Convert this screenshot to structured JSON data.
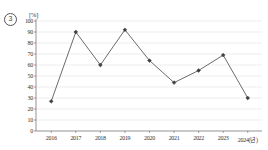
{
  "question_number": "3",
  "chart_data": {
    "type": "line",
    "title": "",
    "xlabel": "",
    "ylabel": "",
    "unit_label": "[%]",
    "x_axis_suffix": "(년)",
    "categories": [
      "2016",
      "2017",
      "2018",
      "2019",
      "2020",
      "2021",
      "2022",
      "2023",
      "2024"
    ],
    "x_tick_labels": [
      "2016",
      "2017",
      "2018",
      "2019",
      "2020",
      "2021",
      "2022",
      "2023",
      "2024(년)"
    ],
    "values": [
      27,
      90,
      60,
      92,
      64,
      44,
      55,
      69,
      30
    ],
    "y_tick_labels": [
      "0",
      "10",
      "20",
      "30",
      "40",
      "50",
      "60",
      "70",
      "80",
      "90",
      "100"
    ],
    "y_ticks": [
      0,
      10,
      20,
      30,
      40,
      50,
      60,
      70,
      80,
      90,
      100
    ],
    "ylim": [
      0,
      100
    ],
    "grid": true,
    "legend": "none",
    "series": [
      {
        "name": "series-1",
        "values": [
          27,
          90,
          60,
          92,
          64,
          44,
          55,
          69,
          30
        ]
      }
    ],
    "colors": {
      "line": "#5a5a5a",
      "marker": "#3f3f3f",
      "grid": "#d8d8d8",
      "axis": "#666666",
      "text": "#333333"
    }
  }
}
